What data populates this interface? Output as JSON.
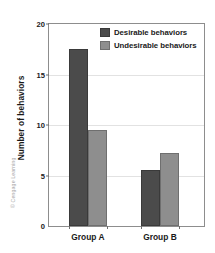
{
  "chart_data": {
    "type": "bar",
    "title": "",
    "subtitle": "",
    "xlabel": "",
    "ylabel": "Number of behaviors",
    "categories": [
      "Group A",
      "Group B"
    ],
    "series": [
      {
        "name": "Desirable behaviors",
        "values": [
          17.5,
          5.5
        ],
        "color": "#4b4b4b"
      },
      {
        "name": "Undesirable behaviors",
        "values": [
          9.5,
          7.2
        ],
        "color": "#8e8e8e"
      }
    ],
    "ylim": [
      0,
      20
    ],
    "yticks": [
      0,
      5,
      10,
      15,
      20
    ],
    "ytick_labels": [
      "0",
      "5",
      "10",
      "15",
      "20"
    ],
    "grid": true,
    "grid_axis": "y",
    "legend_position": "top-left-inside",
    "bar_group_gap": true
  },
  "legend": {
    "entries": [
      {
        "label": "Desirable behaviors"
      },
      {
        "label": "Undesirable behaviors"
      }
    ]
  },
  "axes": {
    "y_title": "Number of behaviors",
    "y_tick_labels": [
      "20",
      "15",
      "10",
      "5",
      "0"
    ],
    "x_tick_labels": [
      "Group A",
      "Group B"
    ]
  },
  "credit": {
    "text": "© Cengage Learning"
  },
  "colors": {
    "desirable": "#4b4b4b",
    "undesirable": "#8e8e8e",
    "frame": "#8d8d8d",
    "grid": "#e2e2e2",
    "text": "#1a1a1a",
    "credit": "#a6a6a6",
    "background": "#ffffff"
  }
}
